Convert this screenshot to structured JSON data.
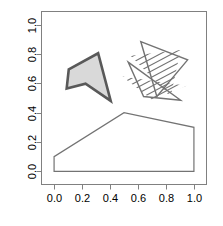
{
  "figure": {
    "title": "",
    "background_color": "#ffffff",
    "width": 223,
    "height": 226
  },
  "axes": {
    "box_color": "#808080",
    "tick_color": "#808080",
    "label_color": "#000000",
    "x_ticks": [
      "0.0",
      "0.2",
      "0.4",
      "0.6",
      "0.8",
      "1.0"
    ],
    "y_ticks": [
      "0.0",
      "0.2",
      "0.4",
      "0.6",
      "0.8",
      "1.0"
    ],
    "xlabel": "",
    "ylabel": "",
    "xlim": [
      -0.09,
      1.09
    ],
    "ylim": [
      -0.09,
      1.09
    ],
    "y_label_rotation": -90
  },
  "chart_data": {
    "type": "scatter",
    "title": "",
    "xlabel": "",
    "ylabel": "",
    "xlim": [
      -0.09,
      1.09
    ],
    "ylim": [
      -0.09,
      1.09
    ],
    "grid": false,
    "legend": "none",
    "x_tick_values": [
      0.0,
      0.2,
      0.4,
      0.6,
      0.8,
      1.0
    ],
    "y_tick_values": [
      0.0,
      0.2,
      0.4,
      0.6,
      0.8,
      1.0
    ],
    "series": [
      {
        "name": "filled-dart",
        "shape": "polygon",
        "fill": "#d9d9d9",
        "stroke": "#595959",
        "stroke_width": 2.6,
        "hatch": "none",
        "points": [
          [
            0.105,
            0.695
          ],
          [
            0.315,
            0.805
          ],
          [
            0.405,
            0.48
          ],
          [
            0.225,
            0.598
          ],
          [
            0.09,
            0.565
          ]
        ]
      },
      {
        "name": "hatched-triangle-upper",
        "shape": "polygon",
        "fill": "none",
        "stroke": "#737373",
        "stroke_width": 1.4,
        "hatch": "diagonal-lines",
        "hatch_angle": 28,
        "hatch_spacing": 5.5,
        "points": [
          [
            0.62,
            0.885
          ],
          [
            0.955,
            0.76
          ],
          [
            0.735,
            0.51
          ]
        ]
      },
      {
        "name": "hatched-triangle-lower",
        "shape": "polygon",
        "fill": "none",
        "stroke": "#737373",
        "stroke_width": 1.4,
        "hatch": "diagonal-lines",
        "hatch_angle": 28,
        "hatch_spacing": 5.5,
        "points": [
          [
            0.53,
            0.745
          ],
          [
            0.905,
            0.485
          ],
          [
            0.64,
            0.51
          ]
        ]
      },
      {
        "name": "outlined-pentagon",
        "shape": "polygon",
        "fill": "none",
        "stroke": "#737373",
        "stroke_width": 1.2,
        "hatch": "none",
        "points": [
          [
            0.0,
            0.0
          ],
          [
            0.0,
            0.1
          ],
          [
            0.5,
            0.4
          ],
          [
            1.0,
            0.3
          ],
          [
            1.0,
            0.0
          ]
        ]
      }
    ]
  }
}
